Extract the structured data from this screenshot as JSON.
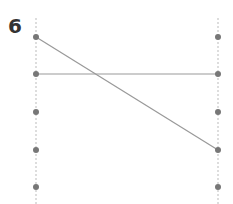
{
  "diagram": {
    "label": "6",
    "colors": {
      "dot": "#777777",
      "line": "#999999",
      "axis": "#bbbbbb",
      "label": "#333333"
    },
    "columns": {
      "left": {
        "x": 36,
        "dots_y": [
          37,
          74,
          112,
          150,
          187
        ]
      },
      "right": {
        "x": 218,
        "dots_y": [
          37,
          74,
          112,
          150,
          187
        ]
      }
    },
    "connections": [
      {
        "from_left_index": 0,
        "to_right_index": 3
      },
      {
        "from_left_index": 1,
        "to_right_index": 1
      }
    ]
  }
}
